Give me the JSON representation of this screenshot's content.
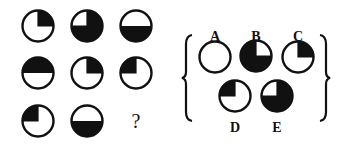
{
  "puzzle": {
    "question_mark": "?",
    "grid": [
      {
        "row": 1,
        "col": 1,
        "shape": "quarter-black",
        "quadrant": "top-right",
        "cx": 38,
        "cy": 26
      },
      {
        "row": 1,
        "col": 2,
        "shape": "three-quarter-black",
        "white_quadrant": "top-left",
        "cx": 87,
        "cy": 26
      },
      {
        "row": 1,
        "col": 3,
        "shape": "half-black",
        "half": "bottom",
        "cx": 136,
        "cy": 26
      },
      {
        "row": 2,
        "col": 1,
        "shape": "half-black",
        "half": "top",
        "cx": 38,
        "cy": 73
      },
      {
        "row": 2,
        "col": 2,
        "shape": "quarter-black",
        "quadrant": "top-right",
        "cx": 87,
        "cy": 73
      },
      {
        "row": 2,
        "col": 3,
        "shape": "quarter-black",
        "quadrant": "top-left",
        "cx": 136,
        "cy": 73
      },
      {
        "row": 3,
        "col": 1,
        "shape": "quarter-black",
        "quadrant": "top-left",
        "cx": 38,
        "cy": 121
      },
      {
        "row": 3,
        "col": 2,
        "shape": "half-black",
        "half": "bottom",
        "cx": 87,
        "cy": 121
      }
    ],
    "options": [
      {
        "label": "A",
        "shape": "empty",
        "cx": 215,
        "cy": 57,
        "lx": 215,
        "ly": 41
      },
      {
        "label": "B",
        "shape": "three-quarter-black",
        "white_quadrant": "top-right",
        "cx": 256,
        "cy": 56,
        "lx": 256,
        "ly": 41
      },
      {
        "label": "C",
        "shape": "quarter-black",
        "quadrant": "top-right",
        "cx": 298,
        "cy": 57,
        "lx": 298,
        "ly": 41
      },
      {
        "label": "D",
        "shape": "quarter-black",
        "quadrant": "top-left",
        "cx": 235,
        "cy": 96,
        "lx": 235,
        "ly": 132
      },
      {
        "label": "E",
        "shape": "three-quarter-black",
        "white_quadrant": "top-left",
        "cx": 277,
        "cy": 96,
        "lx": 277,
        "ly": 132
      }
    ]
  }
}
